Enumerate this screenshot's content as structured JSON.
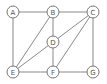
{
  "graph": {
    "nodes": [
      {
        "id": "A",
        "label": "A",
        "x": 13,
        "y": 12
      },
      {
        "id": "B",
        "label": "B",
        "x": 53,
        "y": 12
      },
      {
        "id": "C",
        "label": "C",
        "x": 93,
        "y": 12
      },
      {
        "id": "D",
        "label": "D",
        "x": 53,
        "y": 42
      },
      {
        "id": "E",
        "label": "E",
        "x": 13,
        "y": 72
      },
      {
        "id": "F",
        "label": "F",
        "x": 53,
        "y": 72
      },
      {
        "id": "G",
        "label": "G",
        "x": 93,
        "y": 72
      }
    ],
    "edges": [
      [
        "A",
        "B"
      ],
      [
        "B",
        "C"
      ],
      [
        "A",
        "E"
      ],
      [
        "B",
        "D"
      ],
      [
        "D",
        "F"
      ],
      [
        "B",
        "E"
      ],
      [
        "D",
        "E"
      ],
      [
        "C",
        "D"
      ],
      [
        "C",
        "F"
      ],
      [
        "C",
        "G"
      ],
      [
        "E",
        "F"
      ],
      [
        "F",
        "G"
      ]
    ],
    "style": {
      "edge_color": "#8a8a8a",
      "node_stroke": "#777777",
      "node_fill": "#ffffff",
      "label_color": "#555555",
      "node_radius": 6
    }
  }
}
